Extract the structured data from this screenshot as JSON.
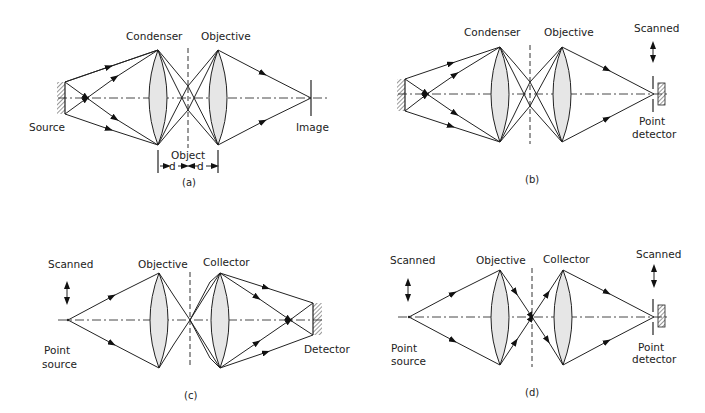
{
  "panels": [
    {
      "id": "a",
      "caption": "(a)",
      "labels": {
        "lens1": "Condenser",
        "lens2": "Objective",
        "left": "Source",
        "right": "Image",
        "object": "Object",
        "d_left": "d",
        "d_right": "d"
      }
    },
    {
      "id": "b",
      "caption": "(b)",
      "labels": {
        "lens1": "Condenser",
        "lens2": "Objective",
        "scanned": "Scanned",
        "right_line1": "Point",
        "right_line2": "detector"
      }
    },
    {
      "id": "c",
      "caption": "(c)",
      "labels": {
        "lens1": "Objective",
        "lens2": "Collector",
        "scanned": "Scanned",
        "left_line1": "Point",
        "left_line2": "source",
        "right": "Detector"
      }
    },
    {
      "id": "d",
      "caption": "(d)",
      "labels": {
        "lens1": "Objective",
        "lens2": "Collector",
        "scanned_left": "Scanned",
        "scanned_right": "Scanned",
        "left_line1": "Point",
        "left_line2": "source",
        "right_line1": "Point",
        "right_line2": "detector"
      }
    }
  ]
}
